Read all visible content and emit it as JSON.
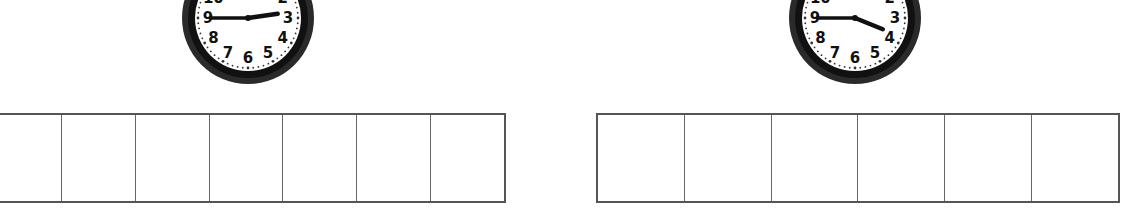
{
  "exercises": [
    {
      "clock": {
        "hour_hand_angle_deg": 82,
        "minute_hand_angle_deg": 270,
        "time_shown": "2:45",
        "numerals": [
          "12",
          "1",
          "2",
          "3",
          "4",
          "5",
          "6",
          "7",
          "8",
          "9",
          "10",
          "11"
        ]
      },
      "answer_cells": [
        "",
        "",
        "",
        "",
        "",
        "",
        ""
      ]
    },
    {
      "clock": {
        "hour_hand_angle_deg": 112,
        "minute_hand_angle_deg": 270,
        "time_shown": "3:45",
        "numerals": [
          "12",
          "1",
          "2",
          "3",
          "4",
          "5",
          "6",
          "7",
          "8",
          "9",
          "10",
          "11"
        ]
      },
      "answer_cells": [
        "",
        "",
        "",
        "",
        "",
        ""
      ]
    }
  ],
  "colors": {
    "frame": "#1a1a1a",
    "face": "#ffffff",
    "grid": "#555555"
  }
}
